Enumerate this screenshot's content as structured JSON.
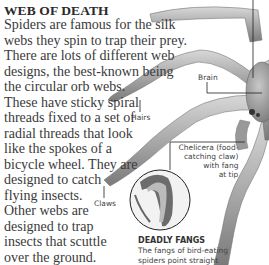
{
  "section1": {
    "heading": "WEB OF DEATH",
    "lines": [
      "Spiders are famous for the silk",
      "webs they spin to trap their prey.",
      "There are lots of different web",
      "designs, the best-known being",
      "the circular orb webs.",
      "These have sticky spiral",
      "threads fixed to a set of",
      "radial threads that look",
      "like the spokes of a",
      "bicycle wheel. They are",
      "designed to catch",
      "flying insects.",
      "Other webs are",
      "designed to trap",
      "insects that scuttle",
      "over the ground."
    ]
  },
  "section2": {
    "heading": "HUNTING OR TRAPPING",
    "lines": [
      "The Australian dinopis spider",
      "spins a net, and holding this"
    ]
  },
  "illustration": {
    "labels": {
      "brain": "Brain",
      "hairs": "Hairs",
      "claws": "Claws",
      "chelicera": [
        "Chelicera (food-",
        "catching claw)",
        "with fang",
        "at tip"
      ]
    },
    "caption": {
      "heading": "DEADLY FANGS",
      "lines": [
        "The fangs of bird-eating",
        "spiders point straight"
      ]
    }
  }
}
